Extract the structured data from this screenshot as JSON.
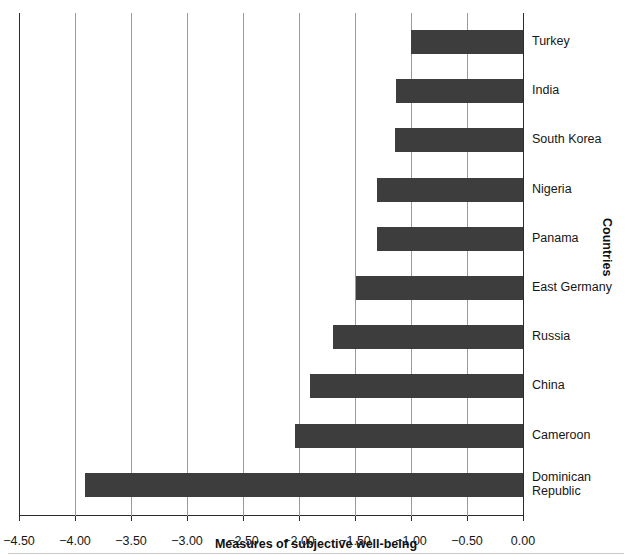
{
  "chart_data": {
    "type": "bar",
    "orientation": "horizontal",
    "title": "",
    "xlabel": "Measures of subjective well-being",
    "ylabel": "Countries",
    "xlim": [
      -4.5,
      0.0
    ],
    "xticks": [
      "-4.50",
      "-4.00",
      "-3.50",
      "-3.00",
      "-2.50",
      "-2.00",
      "-1.50",
      "-1.00",
      "-0.50",
      "0.00"
    ],
    "xtick_values": [
      -4.5,
      -4.0,
      -3.5,
      -3.0,
      -2.5,
      -2.0,
      -1.5,
      -1.0,
      -0.5,
      0.0
    ],
    "grid": "vertical",
    "legend": "none",
    "bar_color": "#3d3d3d",
    "categories": [
      "Turkey",
      "India",
      "South Korea",
      "Nigeria",
      "Panama",
      "East Germany",
      "Russia",
      "China",
      "Cameroon",
      "Dominican\nRepublic"
    ],
    "values": [
      -1.0,
      -1.13,
      -1.14,
      -1.3,
      -1.3,
      -1.49,
      -1.7,
      -1.9,
      -2.04,
      -3.91
    ]
  }
}
